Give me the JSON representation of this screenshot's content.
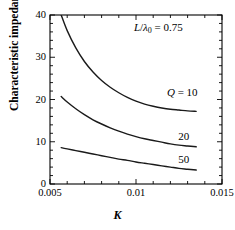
{
  "chart_data": {
    "type": "line",
    "title": "",
    "xlabel": "K",
    "ylabel": "Characteristic impedance Z",
    "ylabel_sub": "c",
    "ylabel_unit": "[Ω]",
    "xlim": [
      0.005,
      0.015
    ],
    "ylim": [
      0,
      40
    ],
    "xticks": [
      0.005,
      0.01,
      0.015
    ],
    "xtick_labels": [
      "0.005",
      "0.01",
      "0.015"
    ],
    "yticks": [
      0,
      10,
      20,
      30,
      40
    ],
    "ytick_labels": [
      "0",
      "10",
      "20",
      "30",
      "40"
    ],
    "x_minor_count": 5,
    "y_minor_count": 5,
    "grid": false,
    "legend_position": "inline-right",
    "annotations": [
      {
        "name": "length-ratio-annotation",
        "text_parts": [
          "L",
          "/",
          "λ",
          "0",
          " = 0.75"
        ],
        "display": "L/λ0 = 0.75",
        "x": 0.0113,
        "y": 37.0
      }
    ],
    "series": [
      {
        "name": "Q = 10",
        "label": "Q = 10",
        "q_value": 10,
        "color": "#1a1a1a",
        "label_x": 0.0118,
        "label_y": 21.6,
        "x": [
          0.00565,
          0.006,
          0.0065,
          0.007,
          0.0075,
          0.008,
          0.0085,
          0.009,
          0.0095,
          0.01,
          0.0105,
          0.011,
          0.0115,
          0.012,
          0.0125,
          0.013,
          0.0135
        ],
        "y": [
          40.0,
          36.3,
          32.2,
          29.0,
          26.5,
          24.5,
          22.9,
          21.6,
          20.5,
          19.6,
          18.9,
          18.4,
          18.0,
          17.7,
          17.5,
          17.3,
          17.2
        ]
      },
      {
        "name": "Q = 20",
        "label": "20",
        "q_value": 20,
        "color": "#1a1a1a",
        "label_x": 0.01245,
        "label_y": 11.2,
        "x": [
          0.00565,
          0.006,
          0.0065,
          0.007,
          0.0075,
          0.008,
          0.0085,
          0.009,
          0.0095,
          0.01,
          0.0105,
          0.011,
          0.0115,
          0.012,
          0.0125,
          0.013,
          0.0135
        ],
        "y": [
          20.7,
          19.4,
          17.8,
          16.4,
          15.2,
          14.2,
          13.3,
          12.5,
          11.8,
          11.2,
          10.7,
          10.3,
          9.9,
          9.5,
          9.2,
          9.0,
          8.8
        ]
      },
      {
        "name": "Q = 50",
        "label": "50",
        "q_value": 50,
        "color": "#1a1a1a",
        "label_x": 0.01245,
        "label_y": 5.6,
        "x": [
          0.00565,
          0.006,
          0.0065,
          0.007,
          0.0075,
          0.008,
          0.0085,
          0.009,
          0.0095,
          0.01,
          0.0105,
          0.011,
          0.0115,
          0.012,
          0.0125,
          0.013,
          0.0135
        ],
        "y": [
          8.6,
          8.3,
          7.9,
          7.5,
          7.1,
          6.7,
          6.3,
          5.9,
          5.6,
          5.2,
          4.9,
          4.6,
          4.3,
          4.0,
          3.7,
          3.5,
          3.3
        ]
      }
    ]
  },
  "figure": {
    "plot_left": 50,
    "plot_right": 222,
    "plot_top": 15,
    "plot_bottom": 184
  }
}
